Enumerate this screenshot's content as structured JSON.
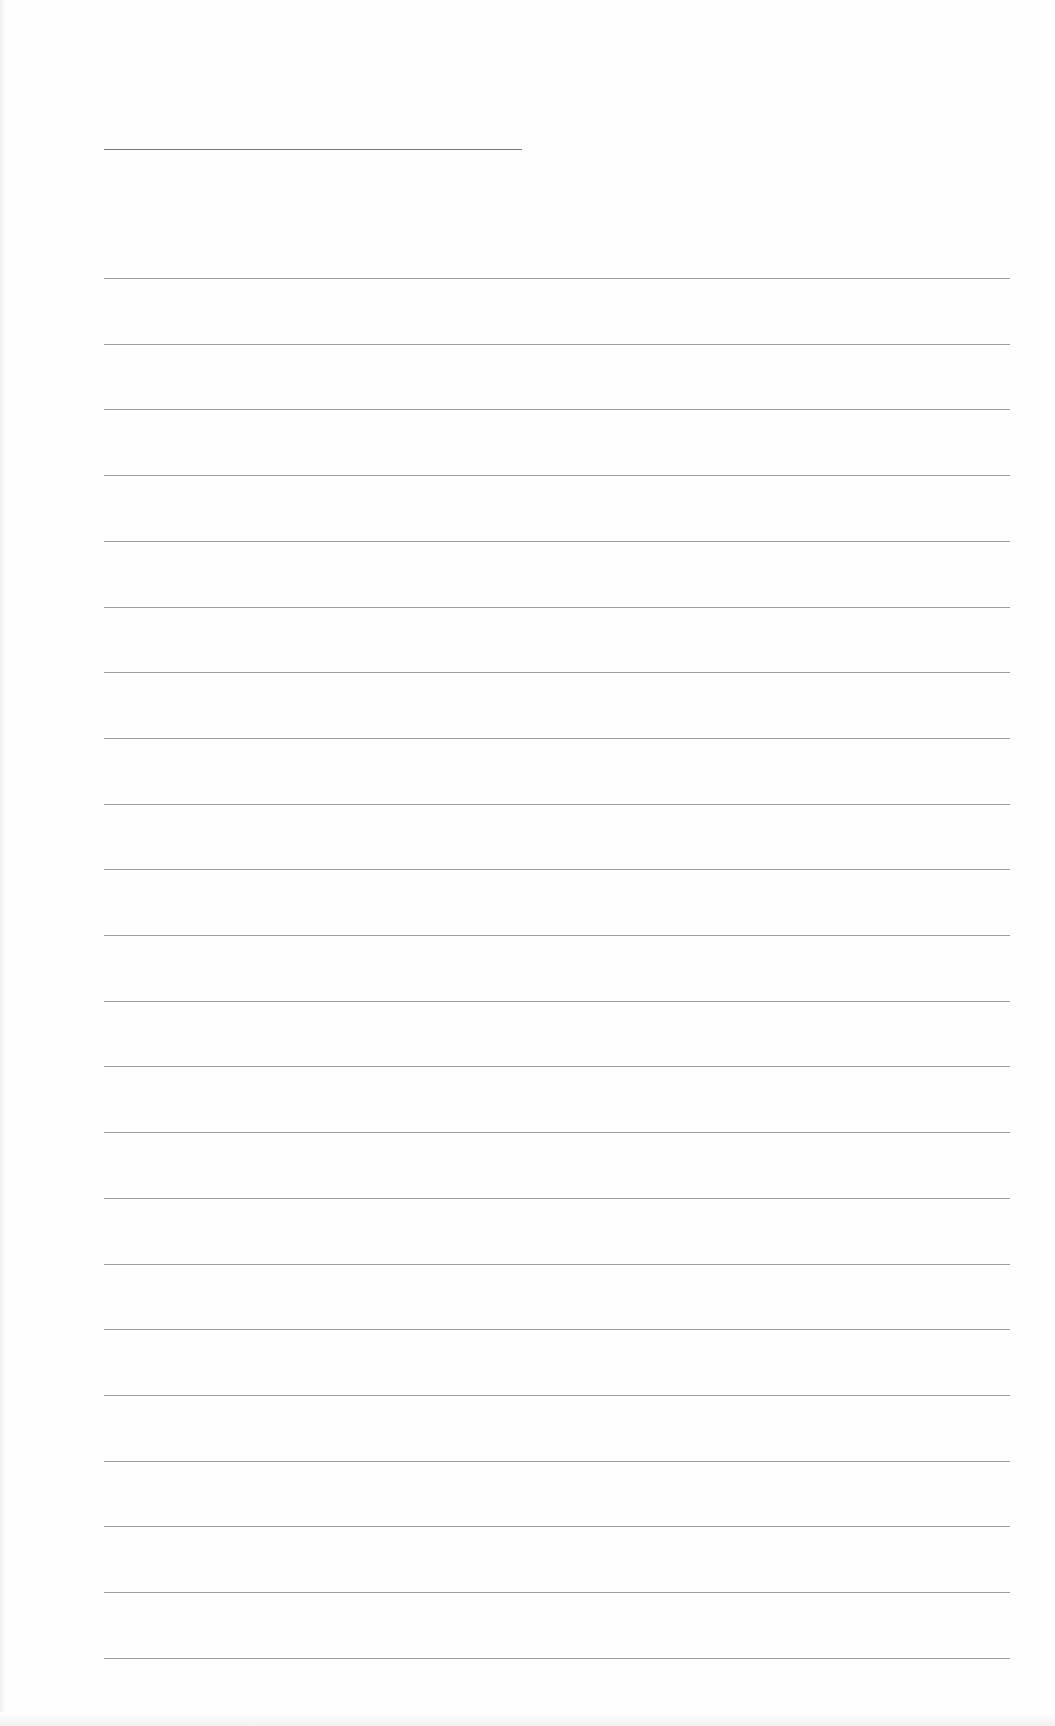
{
  "page": {
    "type": "blank-lined-sheet",
    "background": "#fefefe",
    "line_color": "#8c8c8c",
    "header_line": {
      "x": 104,
      "y": 149,
      "width": 418
    },
    "ruled_lines": {
      "x": 104,
      "width": 906,
      "first_y": 278,
      "spacing": 65.7,
      "count": 22
    }
  }
}
